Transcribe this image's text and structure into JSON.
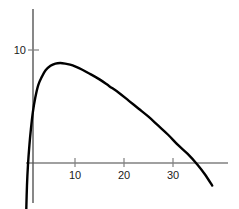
{
  "chart_data": {
    "type": "line",
    "title": "",
    "subtitle": "",
    "xlabel": "",
    "ylabel": "",
    "xlim": [
      -1.5,
      39
    ],
    "ylim": [
      -4.5,
      13.5
    ],
    "grid": false,
    "legend": null,
    "annotations": [],
    "x_ticks": [
      10,
      20,
      30
    ],
    "x_tick_labels": [
      "10",
      "20",
      "30"
    ],
    "y_ticks": [
      10
    ],
    "y_tick_labels": [
      "10"
    ],
    "axis_color": "#808080",
    "curve_color": "#000000",
    "curve_width": 2.4,
    "series": [
      {
        "name": "curve",
        "x": [
          0.05,
          0.2,
          0.4,
          0.7,
          1.0,
          1.4,
          1.9,
          2.5,
          3.2,
          4.0,
          5.0,
          6.0,
          7.0,
          8.0,
          9.0,
          10.0,
          11.5,
          13.0,
          15.0,
          17.0,
          19.0,
          21.0,
          23.0,
          25.0,
          27.0,
          29.0,
          31.0,
          33.0,
          35.0,
          36.5,
          38.0
        ],
        "y": [
          -4.2,
          -2.0,
          -0.2,
          1.6,
          3.0,
          4.5,
          5.8,
          6.9,
          7.6,
          8.2,
          8.6,
          8.8,
          8.85,
          8.8,
          8.7,
          8.55,
          8.25,
          7.9,
          7.4,
          6.8,
          6.2,
          5.5,
          4.8,
          4.1,
          3.3,
          2.5,
          1.6,
          0.8,
          -0.15,
          -1.0,
          -2.0
        ]
      }
    ]
  },
  "axes": {
    "y_axis_label_10": "10",
    "x_axis_label_10": "10",
    "x_axis_label_20": "20",
    "x_axis_label_30": "30"
  }
}
